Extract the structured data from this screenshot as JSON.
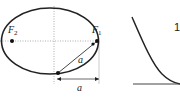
{
  "diagram": {
    "left_figure": {
      "type": "ellipse-with-foci",
      "foci": [
        {
          "label": "F",
          "subscript": "2"
        },
        {
          "label": "F",
          "subscript": "1"
        }
      ],
      "segment_label": "a",
      "dimension_label": "a"
    },
    "right_figure": {
      "type": "curve",
      "partial_label": "1"
    },
    "colors": {
      "stroke": "#222222",
      "guide": "#999999",
      "background": "#ffffff"
    }
  }
}
